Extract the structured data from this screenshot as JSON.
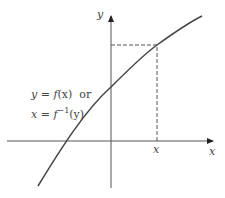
{
  "diagram": {
    "type": "function-graph",
    "x_axis_label": "x",
    "y_axis_label": "y",
    "x_marker_label": "x",
    "equation_line1": {
      "lhs": "y",
      "eq": " = ",
      "f": "f",
      "arg": "(x)",
      "or": "or"
    },
    "equation_line2": {
      "lhs": "x",
      "eq": " = ",
      "f": "f",
      "sup": "−1",
      "arg": "(y)"
    },
    "colors": {
      "curve": "#444444",
      "axes": "#555555",
      "dashed": "#555555",
      "text": "#444444"
    }
  }
}
